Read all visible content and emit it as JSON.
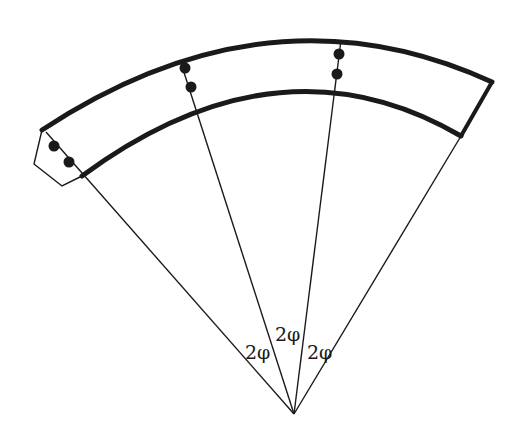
{
  "diagram": {
    "title": "",
    "angle_labels": [
      {
        "id": "left",
        "text": "2φ"
      },
      {
        "id": "middle",
        "text": "2φ"
      },
      {
        "id": "right",
        "text": "2φ"
      }
    ],
    "colors": {
      "stroke": "#1a1a1a",
      "background": "#ffffff"
    }
  }
}
